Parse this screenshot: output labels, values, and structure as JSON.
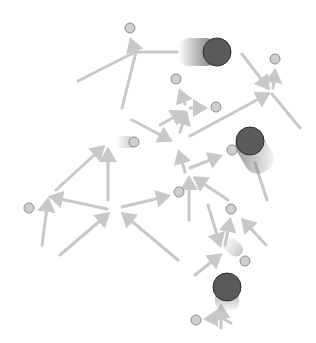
{
  "diagram": {
    "type": "directed-graph",
    "colors": {
      "background": "#ffffff",
      "edge": "#c8c8c8",
      "small_node_fill": "#cfcfcf",
      "small_node_stroke": "#8a8a8a",
      "big_node_fill": "#5a5a5a",
      "big_node_stroke": "#2e2e2e"
    },
    "small_nodes": [
      {
        "id": "n1",
        "x": 130,
        "y": 28
      },
      {
        "id": "n2",
        "x": 275,
        "y": 59
      },
      {
        "id": "n3",
        "x": 176,
        "y": 79
      },
      {
        "id": "n4",
        "x": 216,
        "y": 107
      },
      {
        "id": "n5",
        "x": 134,
        "y": 142
      },
      {
        "id": "n6",
        "x": 232,
        "y": 150
      },
      {
        "id": "n7",
        "x": 29,
        "y": 208
      },
      {
        "id": "n8",
        "x": 179,
        "y": 192
      },
      {
        "id": "n9",
        "x": 231,
        "y": 209
      },
      {
        "id": "n10",
        "x": 245,
        "y": 261
      },
      {
        "id": "n11",
        "x": 196,
        "y": 320
      }
    ],
    "big_nodes": [
      {
        "id": "b1",
        "x": 217,
        "y": 52,
        "r": 14,
        "trail": "left"
      },
      {
        "id": "b2",
        "x": 250,
        "y": 141,
        "r": 14,
        "trail": "down-right"
      },
      {
        "id": "b3",
        "x": 227,
        "y": 287,
        "r": 14,
        "trail": "down"
      }
    ],
    "edges": [
      {
        "x1": 135,
        "y1": 52,
        "x2": 131,
        "y2": 40,
        "arrow": true
      },
      {
        "x1": 78,
        "y1": 81,
        "x2": 135,
        "y2": 52,
        "arrow": false
      },
      {
        "x1": 122,
        "y1": 108,
        "x2": 136,
        "y2": 52,
        "arrow": false
      },
      {
        "x1": 136,
        "y1": 52,
        "x2": 177,
        "y2": 52,
        "arrow": false
      },
      {
        "x1": 242,
        "y1": 54,
        "x2": 268,
        "y2": 88,
        "arrow": true
      },
      {
        "x1": 273,
        "y1": 88,
        "x2": 275,
        "y2": 71,
        "arrow": true
      },
      {
        "x1": 272,
        "y1": 94,
        "x2": 300,
        "y2": 128,
        "arrow": false
      },
      {
        "x1": 190,
        "y1": 136,
        "x2": 268,
        "y2": 94,
        "arrow": true
      },
      {
        "x1": 185,
        "y1": 104,
        "x2": 180,
        "y2": 91,
        "arrow": true
      },
      {
        "x1": 190,
        "y1": 108,
        "x2": 205,
        "y2": 108,
        "arrow": true
      },
      {
        "x1": 160,
        "y1": 125,
        "x2": 183,
        "y2": 112,
        "arrow": true
      },
      {
        "x1": 180,
        "y1": 132,
        "x2": 186,
        "y2": 113,
        "arrow": true
      },
      {
        "x1": 132,
        "y1": 120,
        "x2": 170,
        "y2": 140,
        "arrow": true
      },
      {
        "x1": 185,
        "y1": 172,
        "x2": 179,
        "y2": 152,
        "arrow": true
      },
      {
        "x1": 190,
        "y1": 168,
        "x2": 220,
        "y2": 156,
        "arrow": true
      },
      {
        "x1": 56,
        "y1": 190,
        "x2": 103,
        "y2": 147,
        "arrow": true
      },
      {
        "x1": 108,
        "y1": 200,
        "x2": 108,
        "y2": 150,
        "arrow": true
      },
      {
        "x1": 107,
        "y1": 209,
        "x2": 51,
        "y2": 197,
        "arrow": true
      },
      {
        "x1": 42,
        "y1": 245,
        "x2": 48,
        "y2": 200,
        "arrow": true
      },
      {
        "x1": 122,
        "y1": 207,
        "x2": 168,
        "y2": 196,
        "arrow": true
      },
      {
        "x1": 60,
        "y1": 255,
        "x2": 108,
        "y2": 214,
        "arrow": true
      },
      {
        "x1": 178,
        "y1": 260,
        "x2": 123,
        "y2": 214,
        "arrow": true
      },
      {
        "x1": 189,
        "y1": 220,
        "x2": 189,
        "y2": 178,
        "arrow": true
      },
      {
        "x1": 228,
        "y1": 200,
        "x2": 195,
        "y2": 178,
        "arrow": true
      },
      {
        "x1": 267,
        "y1": 200,
        "x2": 255,
        "y2": 163,
        "arrow": false
      },
      {
        "x1": 208,
        "y1": 205,
        "x2": 220,
        "y2": 245,
        "arrow": true
      },
      {
        "x1": 225,
        "y1": 245,
        "x2": 230,
        "y2": 220,
        "arrow": true
      },
      {
        "x1": 266,
        "y1": 245,
        "x2": 243,
        "y2": 220,
        "arrow": true
      },
      {
        "x1": 195,
        "y1": 275,
        "x2": 220,
        "y2": 255,
        "arrow": true
      },
      {
        "x1": 221,
        "y1": 328,
        "x2": 221,
        "y2": 306,
        "arrow": true
      },
      {
        "x1": 220,
        "y1": 318,
        "x2": 206,
        "y2": 319,
        "arrow": true
      },
      {
        "x1": 222,
        "y1": 318,
        "x2": 231,
        "y2": 323,
        "arrow": false
      }
    ]
  }
}
